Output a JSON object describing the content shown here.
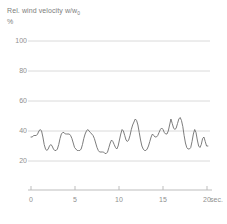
{
  "chart_data": {
    "type": "line",
    "title": "Rel. wind velocity w/w0",
    "title_main": "Rel. wind velocity w/w",
    "title_sub": "0",
    "ylabel": "%",
    "xlabel": "sec.",
    "subtitle": "",
    "grid": true,
    "legend": "none",
    "xlim": [
      0,
      22
    ],
    "ylim": [
      10,
      105
    ],
    "yticks": [
      100,
      80,
      60,
      40,
      20
    ],
    "ytick_labels": [
      "100",
      "80",
      "60",
      "40",
      "20"
    ],
    "xticks": [
      0,
      5,
      10,
      15,
      20
    ],
    "xtick_labels": [
      "0",
      "5",
      "10",
      "15",
      "20"
    ],
    "series": [
      {
        "name": "Rel. wind velocity",
        "color": "#6e6e6e",
        "x": [
          0.0,
          0.15,
          0.3,
          0.45,
          0.6,
          0.75,
          0.9,
          1.05,
          1.2,
          1.35,
          1.5,
          1.65,
          1.8,
          1.95,
          2.1,
          2.25,
          2.4,
          2.55,
          2.7,
          2.85,
          3.0,
          3.15,
          3.3,
          3.45,
          3.6,
          3.75,
          3.9,
          4.05,
          4.2,
          4.35,
          4.5,
          4.65,
          4.8,
          4.95,
          5.1,
          5.25,
          5.4,
          5.55,
          5.7,
          5.85,
          6.0,
          6.15,
          6.3,
          6.45,
          6.6,
          6.75,
          6.9,
          7.05,
          7.2,
          7.35,
          7.5,
          7.65,
          7.8,
          7.95,
          8.1,
          8.25,
          8.4,
          8.55,
          8.7,
          8.85,
          9.0,
          9.15,
          9.3,
          9.45,
          9.6,
          9.75,
          9.9,
          10.05,
          10.2,
          10.35,
          10.5,
          10.65,
          10.8,
          10.95,
          11.1,
          11.25,
          11.4,
          11.55,
          11.7,
          11.85,
          12.0,
          12.15,
          12.3,
          12.45,
          12.6,
          12.75,
          12.9,
          13.05,
          13.2,
          13.35,
          13.5,
          13.65,
          13.8,
          13.95,
          14.1,
          14.25,
          14.4,
          14.55,
          14.7,
          14.85,
          15.0,
          15.15,
          15.3,
          15.45,
          15.6,
          15.75,
          15.9,
          16.05,
          16.2,
          16.35,
          16.5,
          16.65,
          16.8,
          16.95,
          17.1,
          17.25,
          17.4,
          17.55,
          17.7,
          17.85,
          18.0,
          18.15,
          18.3,
          18.45,
          18.6,
          18.75,
          18.9,
          19.05,
          19.2,
          19.35,
          19.5,
          19.65,
          19.8,
          19.95,
          20.1
        ],
        "y": [
          36,
          36,
          37,
          37,
          37,
          38,
          40,
          41,
          40,
          36,
          31,
          28,
          27,
          28,
          30,
          31,
          30,
          28,
          27,
          27,
          28,
          31,
          35,
          38,
          39,
          39,
          38,
          38,
          38,
          38,
          37,
          35,
          32,
          29,
          28,
          27,
          27,
          27,
          28,
          31,
          35,
          38,
          40,
          41,
          40,
          39,
          38,
          37,
          35,
          32,
          29,
          27,
          26,
          26,
          26,
          26,
          25,
          25,
          26,
          29,
          32,
          34,
          33,
          31,
          29,
          28,
          30,
          34,
          38,
          41,
          40,
          37,
          34,
          33,
          34,
          37,
          41,
          44,
          46,
          48,
          47,
          44,
          39,
          34,
          30,
          28,
          27,
          27,
          28,
          30,
          33,
          36,
          38,
          37,
          36,
          36,
          37,
          39,
          41,
          42,
          41,
          39,
          38,
          38,
          40,
          44,
          48,
          45,
          42,
          41,
          42,
          45,
          48,
          49,
          47,
          43,
          37,
          32,
          29,
          28,
          28,
          29,
          33,
          38,
          41,
          39,
          34,
          30,
          29,
          31,
          35,
          36,
          33,
          30,
          30
        ]
      }
    ]
  }
}
